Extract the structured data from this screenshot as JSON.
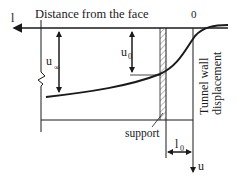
{
  "diagram": {
    "title": "Distance from the face",
    "axis_left_label": "l",
    "origin_label": "0",
    "u_inf_label": "u",
    "u_inf_sub": "∞",
    "u0_label": "u",
    "u0_sub": "0",
    "support_label": "support",
    "l0_label": "l",
    "l0_sub": "0",
    "u_axis_label": "u",
    "vertical_label_line1": "Tunnel wall",
    "vertical_label_line2": "displacement",
    "colors": {
      "ink": "#1a1a1a",
      "hatch": "#777777",
      "background": "#ffffff"
    }
  }
}
